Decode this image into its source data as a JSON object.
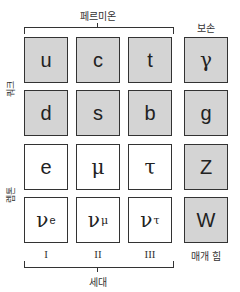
{
  "labels": {
    "fermions": "페르미온",
    "bosons": "보손",
    "quarks": "쿼크",
    "leptons": "렙톤",
    "generations": "세대",
    "force_carriers": "매개 힘"
  },
  "generation_numerals": [
    "I",
    "II",
    "III"
  ],
  "grid": {
    "quarks_row1": [
      {
        "symbol": "u",
        "sub": ""
      },
      {
        "symbol": "c",
        "sub": ""
      },
      {
        "symbol": "t",
        "sub": ""
      }
    ],
    "quarks_row2": [
      {
        "symbol": "d",
        "sub": ""
      },
      {
        "symbol": "s",
        "sub": ""
      },
      {
        "symbol": "b",
        "sub": ""
      }
    ],
    "leptons_row1": [
      {
        "symbol": "e",
        "sub": ""
      },
      {
        "symbol": "μ",
        "sub": ""
      },
      {
        "symbol": "τ",
        "sub": ""
      }
    ],
    "leptons_row2": [
      {
        "symbol": "ν",
        "sub": "e"
      },
      {
        "symbol": "ν",
        "sub": "μ"
      },
      {
        "symbol": "ν",
        "sub": "τ"
      }
    ]
  },
  "bosons": [
    {
      "symbol": "γ"
    },
    {
      "symbol": "g"
    },
    {
      "symbol": "Z"
    },
    {
      "symbol": "W"
    }
  ],
  "colors": {
    "quark_fill": "#d4d4d4",
    "lepton_fill": "#ffffff",
    "boson_fill": "#d4d4d4",
    "border": "#333333"
  }
}
